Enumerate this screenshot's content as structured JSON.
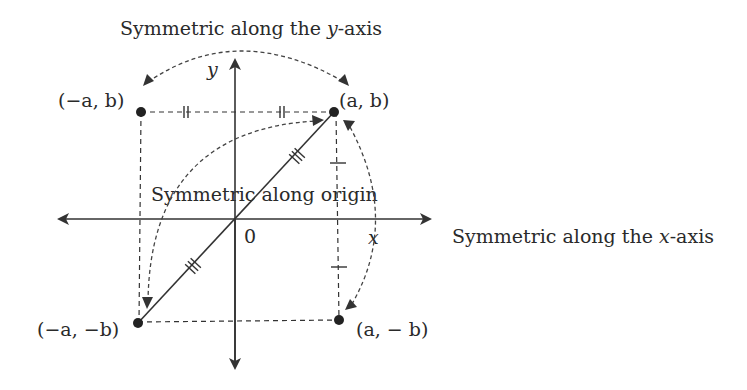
{
  "title_y_axis": "Symmetric along the y-axis",
  "label_x_axis_symmetry": "Symmetric along the x-axis",
  "label_origin_symmetry": "Symmetric along origin",
  "axes": {
    "x_label": "x",
    "y_label": "y",
    "origin_label": "0"
  },
  "points": [
    {
      "id": "P1",
      "label": "(a, b)"
    },
    {
      "id": "P2",
      "label": "(−a, b)"
    },
    {
      "id": "P3",
      "label": "(−a, −b)"
    },
    {
      "id": "P4",
      "label": "(a, − b)"
    }
  ],
  "colors": {
    "ink": "#333333",
    "background": "#ffffff"
  }
}
